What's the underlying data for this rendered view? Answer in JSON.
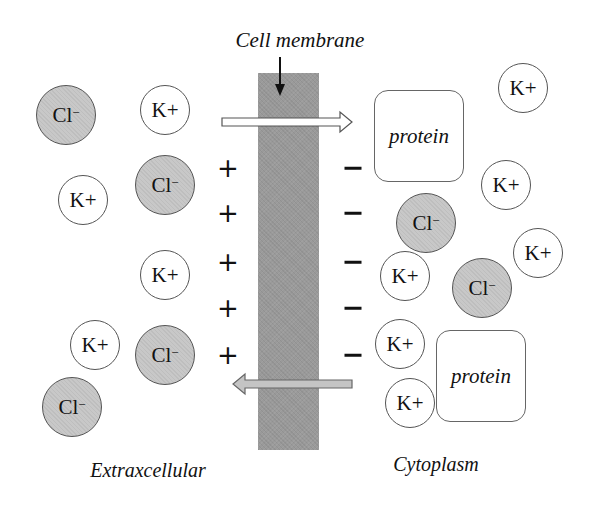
{
  "title": "Cell membrane",
  "regions": {
    "left": "Extraxcellular",
    "right": "Cytoplasm"
  },
  "charges": {
    "left_sign": "+",
    "right_sign": "−",
    "rows": [
      168,
      213,
      262,
      308,
      355
    ]
  },
  "ions": {
    "k_label": "K+",
    "cl_label": "Cl",
    "cl_sup": "−",
    "left": [
      {
        "type": "cl",
        "x": 66,
        "y": 115
      },
      {
        "type": "k",
        "x": 165,
        "y": 110
      },
      {
        "type": "k",
        "x": 83,
        "y": 200
      },
      {
        "type": "cl",
        "x": 165,
        "y": 185
      },
      {
        "type": "k",
        "x": 165,
        "y": 275
      },
      {
        "type": "k",
        "x": 95,
        "y": 345
      },
      {
        "type": "cl",
        "x": 165,
        "y": 355
      },
      {
        "type": "cl",
        "x": 72,
        "y": 407
      }
    ],
    "right": [
      {
        "type": "k",
        "x": 523,
        "y": 88
      },
      {
        "type": "k",
        "x": 506,
        "y": 185
      },
      {
        "type": "cl",
        "x": 426,
        "y": 223
      },
      {
        "type": "k",
        "x": 538,
        "y": 253
      },
      {
        "type": "k",
        "x": 405,
        "y": 276
      },
      {
        "type": "cl",
        "x": 482,
        "y": 288
      },
      {
        "type": "k",
        "x": 400,
        "y": 344
      },
      {
        "type": "k",
        "x": 410,
        "y": 403
      }
    ]
  },
  "proteins": [
    {
      "label": "protein",
      "x": 374,
      "y": 90,
      "w": 90,
      "h": 92
    },
    {
      "label": "protein",
      "x": 436,
      "y": 330,
      "w": 90,
      "h": 92
    }
  ],
  "arrows": [
    {
      "direction": "right",
      "color": "#ffffff",
      "from_x": 222,
      "to_x": 352,
      "y": 122
    },
    {
      "direction": "left",
      "color": "#c4c4c4",
      "from_x": 352,
      "to_x": 233,
      "y": 384
    }
  ],
  "colors": {
    "membrane": "#9a9a9a",
    "cl_fill": "#c8c8c8",
    "k_fill": "#ffffff",
    "stroke": "#555555"
  }
}
